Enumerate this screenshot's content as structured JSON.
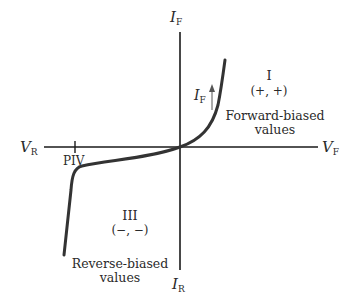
{
  "diagram": {
    "axes": {
      "y_top": {
        "main": "I",
        "sub": "F"
      },
      "y_bottom": {
        "main": "I",
        "sub": "R"
      },
      "x_left": {
        "main": "V",
        "sub": "R"
      },
      "x_right": {
        "main": "V",
        "sub": "F"
      }
    },
    "piv_label": "PIV",
    "quadrant_1": {
      "numeral": "I",
      "signs": "(+, +)",
      "desc_line1": "Forward-biased",
      "desc_line2": "values"
    },
    "quadrant_3": {
      "numeral": "III",
      "signs": "(−, −)",
      "desc_line1": "Reverse-biased",
      "desc_line2": "values"
    },
    "current_arrow": {
      "main": "I",
      "sub": "F"
    },
    "colors": {
      "axis": "#1a1a1a",
      "curve": "#333333",
      "text": "#2a2a2a"
    }
  }
}
